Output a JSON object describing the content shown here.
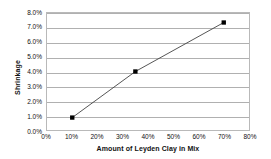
{
  "chart_data": {
    "type": "line",
    "title": "",
    "subtitle": "",
    "xlabel": "Amount of Leyden Clay in Mix",
    "ylabel": "Shrinkage",
    "xlim": [
      0,
      80
    ],
    "ylim": [
      0,
      8
    ],
    "xticks": [
      0,
      10,
      20,
      30,
      40,
      50,
      60,
      70,
      80
    ],
    "xtick_labels": [
      "0%",
      "10%",
      "20%",
      "30%",
      "40%",
      "50%",
      "60%",
      "70%",
      "80%"
    ],
    "yticks": [
      0,
      1,
      2,
      3,
      4,
      5,
      6,
      7,
      8
    ],
    "ytick_labels": [
      "0.0%",
      "1.0%",
      "2.0%",
      "3.0%",
      "4.0%",
      "5.0%",
      "6.0%",
      "7.0%",
      "8.0%"
    ],
    "grid": "horizontal",
    "legend": "none",
    "series": [
      {
        "name": "Shrinkage",
        "line_color": "#404040",
        "marker": "square",
        "marker_color": "#000000",
        "x": [
          10,
          35,
          70
        ],
        "y": [
          0.85,
          4.0,
          7.35
        ],
        "point_labels": [
          "10%, 0.85%",
          "35%, 4.0%",
          "70%, 7.35%"
        ]
      }
    ],
    "colors": {
      "plot_border": "#b9b9b9",
      "gridline": "#b0b0b0",
      "background": "#ffffff",
      "text": "#111111"
    }
  }
}
